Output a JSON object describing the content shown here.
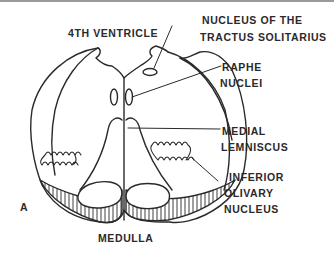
{
  "figure": {
    "panel_letter": "A",
    "title": "MEDULLA",
    "labels": {
      "ventricle": "4TH VENTRICLE",
      "nts_line1": "NUCLEUS OF THE",
      "nts_line2": "TRACTUS SOLITARIUS",
      "raphe_line1": "RAPHE",
      "raphe_line2": "NUCLEI",
      "ml_line1": "MEDIAL",
      "ml_line2": "LEMNISCUS",
      "ion_line1": "INFERIOR",
      "ion_line2": "OLIVARY",
      "ion_line3": "NUCLEUS"
    },
    "colors": {
      "ink": "#2a2a2a",
      "background": "#ffffff",
      "border": "#9a9a9a"
    }
  }
}
